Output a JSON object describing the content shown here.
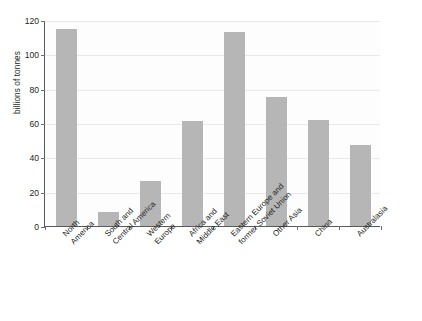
{
  "chart_data": {
    "type": "bar",
    "title": "",
    "subtitle": "",
    "xlabel": "",
    "ylabel": "billions of tonnes",
    "ylim": [
      0,
      120
    ],
    "ytick_step": 20,
    "yticks": [
      0,
      20,
      40,
      60,
      80,
      100,
      120
    ],
    "ytick_labels": [
      "0",
      "20",
      "40",
      "60",
      "80",
      "100",
      "120"
    ],
    "grid": "horizontal",
    "legend": "none",
    "bar_color": "#b6b6b6",
    "axis_color": "#58595b",
    "gridline_color": "#e9e9e9",
    "background_color": "#ffffff",
    "categories": [
      "North America",
      "South and Central America",
      "Western Europe",
      "Africa and Middle East",
      "Eastern Europe and former Soviet Union",
      "Other Asia",
      "China",
      "Australasia"
    ],
    "category_lines": [
      [
        "North",
        "America"
      ],
      [
        "South and",
        "Central America"
      ],
      [
        "Western",
        "Europe"
      ],
      [
        "Africa and",
        "Middle East"
      ],
      [
        "Eastern Europe and",
        "former Soviet Union"
      ],
      [
        "Other Asia"
      ],
      [
        "China"
      ],
      [
        "Australasia"
      ]
    ],
    "values": [
      115,
      8,
      26,
      61,
      113,
      75,
      62,
      47
    ]
  }
}
